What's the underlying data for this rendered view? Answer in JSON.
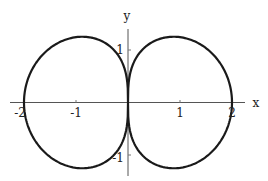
{
  "chart_data": {
    "type": "line",
    "title": "",
    "subtitle": "",
    "xlabel": "x",
    "ylabel": "y",
    "xlim": [
      -2.1,
      2.25
    ],
    "ylim": [
      -1.4,
      1.4
    ],
    "grid": false,
    "legend": null,
    "x_ticks": [
      -2,
      -1,
      1,
      2
    ],
    "x_tick_labels": [
      "-2",
      "-1",
      "1",
      "2"
    ],
    "y_ticks": [
      1,
      -1
    ],
    "y_tick_labels": [
      "1",
      "-1"
    ],
    "annotations": [],
    "series": [
      {
        "name": "r = 2·sqrt(|cos θ|)",
        "key_points": [
          {
            "x": 2.0,
            "y": 0.0
          },
          {
            "x": 1.75,
            "y": 0.84
          },
          {
            "x": 0.88,
            "y": 1.24
          },
          {
            "x": 0.3,
            "y": 0.85
          },
          {
            "x": 0.0,
            "y": 0.0
          },
          {
            "x": 0.3,
            "y": -0.85
          },
          {
            "x": 0.88,
            "y": -1.24
          },
          {
            "x": 1.75,
            "y": -0.84
          },
          {
            "x": -2.0,
            "y": 0.0
          },
          {
            "x": -0.88,
            "y": 1.24
          },
          {
            "x": -0.88,
            "y": -1.24
          }
        ],
        "samples": 360
      }
    ]
  },
  "axes": {
    "x_label": "x",
    "y_label": "y",
    "x_tick_labels": [
      "-2",
      "-1",
      "1",
      "2"
    ],
    "y_tick_labels": [
      "1",
      "-1"
    ]
  }
}
